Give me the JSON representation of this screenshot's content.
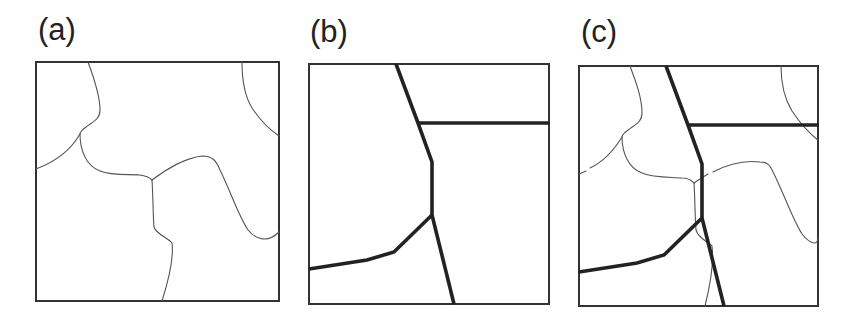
{
  "figure": {
    "panels": [
      {
        "id": "a",
        "label": "(a)",
        "description": "Thin irregular grain-boundary curves"
      },
      {
        "id": "b",
        "label": "(b)",
        "description": "Thick polygonal boundary segments"
      },
      {
        "id": "c",
        "label": "(c)",
        "description": "Overlay of thin curves and thick segments"
      }
    ],
    "colors": {
      "frame": "#333333",
      "thin_line": "#555555",
      "thick_line": "#222222",
      "label": "#222222",
      "background": "#ffffff"
    }
  }
}
